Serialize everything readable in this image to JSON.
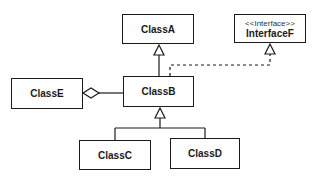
{
  "diagram": {
    "type": "uml-class-diagram",
    "classes": [
      {
        "id": "classA",
        "name": "ClassA",
        "x": 122,
        "y": 14,
        "w": 72,
        "h": 30
      },
      {
        "id": "interfaceF",
        "stereotype": "<<Interface>>",
        "name": "InterfaceF",
        "x": 234,
        "y": 14,
        "w": 72,
        "h": 29
      },
      {
        "id": "classE",
        "name": "ClassE",
        "x": 11,
        "y": 78,
        "w": 72,
        "h": 31
      },
      {
        "id": "classB",
        "name": "ClassB",
        "x": 123,
        "y": 76,
        "w": 71,
        "h": 31
      },
      {
        "id": "classC",
        "name": "ClassC",
        "x": 79,
        "y": 140,
        "w": 72,
        "h": 30
      },
      {
        "id": "classD",
        "name": "ClassD",
        "x": 170,
        "y": 138,
        "w": 70,
        "h": 31
      }
    ],
    "relationships": [
      {
        "type": "generalization",
        "from": "ClassB",
        "to": "ClassA"
      },
      {
        "type": "realization",
        "from": "ClassB",
        "to": "InterfaceF"
      },
      {
        "type": "aggregation",
        "whole": "ClassE",
        "part": "ClassB"
      },
      {
        "type": "generalization",
        "from": "ClassC",
        "to": "ClassB"
      },
      {
        "type": "generalization",
        "from": "ClassD",
        "to": "ClassB"
      }
    ],
    "colors": {
      "stroke": "#1a1a1a",
      "fill": "#ffffff"
    }
  }
}
